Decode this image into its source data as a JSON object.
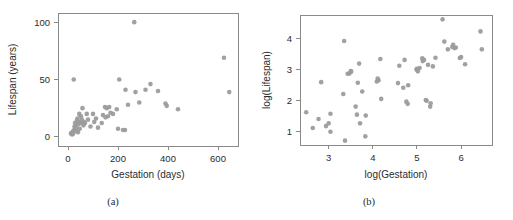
{
  "figure": {
    "background": "#ffffff",
    "point_color": "#9c9c9c",
    "axis_color": "#8a8a8a",
    "text_color": "#2b2b2b"
  },
  "panels": [
    {
      "key": "a",
      "caption": "(a)",
      "xlabel": "Gestation (days)",
      "ylabel": "Lifespan (years)"
    },
    {
      "key": "b",
      "caption": "(b)",
      "xlabel": "log(Gestation)",
      "ylabel": "log(Lifespan)"
    }
  ],
  "chart_data": [
    {
      "type": "scatter",
      "panel": "a",
      "title": "",
      "subtitle": "(a)",
      "xlabel": "Gestation (days)",
      "ylabel": "Lifespan (years)",
      "xlim": [
        -40,
        680
      ],
      "ylim": [
        -8,
        108
      ],
      "xticks": [
        0,
        200,
        400,
        600
      ],
      "xticklabels": [
        "0",
        "200",
        "400",
        "600"
      ],
      "yticks": [
        0,
        50,
        100
      ],
      "yticklabels": [
        "0",
        "50",
        "100"
      ],
      "grid": false,
      "legend": null,
      "marker": "circle",
      "marker_color": "#9c9c9c",
      "points": [
        [
          12,
          3.0
        ],
        [
          15,
          3.5
        ],
        [
          16,
          2.0
        ],
        [
          17,
          3.0
        ],
        [
          18,
          2.5
        ],
        [
          19,
          4.0
        ],
        [
          20,
          4.5
        ],
        [
          21,
          3.0
        ],
        [
          22,
          5.0
        ],
        [
          23,
          50.0
        ],
        [
          25,
          6.0
        ],
        [
          26,
          9.0
        ],
        [
          28,
          12.0
        ],
        [
          30,
          7.0
        ],
        [
          31,
          8.0
        ],
        [
          33,
          10.0
        ],
        [
          35,
          14.0
        ],
        [
          36,
          5.0
        ],
        [
          38,
          16.0
        ],
        [
          40,
          4.0
        ],
        [
          42,
          11.0
        ],
        [
          44,
          13.0
        ],
        [
          45,
          20.0
        ],
        [
          47,
          7.0
        ],
        [
          50,
          12.0
        ],
        [
          52,
          18.0
        ],
        [
          55,
          15.0
        ],
        [
          58,
          25.0
        ],
        [
          60,
          12.0
        ],
        [
          62,
          10.0
        ],
        [
          63,
          13.0
        ],
        [
          68,
          12.0
        ],
        [
          75,
          20.0
        ],
        [
          80,
          15.0
        ],
        [
          90,
          9.0
        ],
        [
          100,
          20.0
        ],
        [
          105,
          13.0
        ],
        [
          112,
          16.0
        ],
        [
          120,
          8.0
        ],
        [
          135,
          12.0
        ],
        [
          140,
          19.0
        ],
        [
          148,
          26.0
        ],
        [
          150,
          17.0
        ],
        [
          155,
          25.0
        ],
        [
          160,
          18.0
        ],
        [
          165,
          26.0
        ],
        [
          170,
          21.0
        ],
        [
          180,
          20.0
        ],
        [
          195,
          24.0
        ],
        [
          200,
          7.0
        ],
        [
          205,
          50.0
        ],
        [
          220,
          6.0
        ],
        [
          228,
          6.0
        ],
        [
          230,
          41.0
        ],
        [
          240,
          28.0
        ],
        [
          265,
          100.0
        ],
        [
          270,
          39.0
        ],
        [
          285,
          30.0
        ],
        [
          310,
          41.0
        ],
        [
          330,
          46.0
        ],
        [
          360,
          40.0
        ],
        [
          390,
          29.0
        ],
        [
          395,
          27.0
        ],
        [
          440,
          24.0
        ],
        [
          624,
          69.0
        ],
        [
          645,
          39.0
        ]
      ]
    },
    {
      "type": "scatter",
      "panel": "b",
      "title": "",
      "subtitle": "(b)",
      "xlabel": "log(Gestation)",
      "ylabel": "log(Lifespan)",
      "xlim": [
        2.35,
        6.7
      ],
      "ylim": [
        0.55,
        4.75
      ],
      "xticks": [
        3,
        4,
        5,
        6
      ],
      "xticklabels": [
        "3",
        "4",
        "5",
        "6"
      ],
      "yticks": [
        1,
        2,
        3,
        4
      ],
      "yticklabels": [
        "1",
        "2",
        "3",
        "4"
      ],
      "grid": false,
      "legend": null,
      "marker": "circle",
      "marker_color": "#9c9c9c",
      "points": [
        [
          2.49,
          1.61
        ],
        [
          2.64,
          1.1
        ],
        [
          2.77,
          1.39
        ],
        [
          2.83,
          2.58
        ],
        [
          2.94,
          1.16
        ],
        [
          3.0,
          1.25
        ],
        [
          3.04,
          1.56
        ],
        [
          3.04,
          0.98
        ],
        [
          3.33,
          2.2
        ],
        [
          3.35,
          3.91
        ],
        [
          3.37,
          0.69
        ],
        [
          3.43,
          2.85
        ],
        [
          3.47,
          2.86
        ],
        [
          3.5,
          2.94
        ],
        [
          3.51,
          2.92
        ],
        [
          3.61,
          1.79
        ],
        [
          3.64,
          1.53
        ],
        [
          3.66,
          2.56
        ],
        [
          3.69,
          3.18
        ],
        [
          3.71,
          1.25
        ],
        [
          3.76,
          2.28
        ],
        [
          3.83,
          0.83
        ],
        [
          3.84,
          1.5
        ],
        [
          4.09,
          2.6
        ],
        [
          4.11,
          2.7
        ],
        [
          4.13,
          2.64
        ],
        [
          4.17,
          3.33
        ],
        [
          4.19,
          2.04
        ],
        [
          4.57,
          2.55
        ],
        [
          4.6,
          3.11
        ],
        [
          4.69,
          2.4
        ],
        [
          4.72,
          3.3
        ],
        [
          4.76,
          1.95
        ],
        [
          4.79,
          1.88
        ],
        [
          4.8,
          2.48
        ],
        [
          4.99,
          2.99
        ],
        [
          5.0,
          3.01
        ],
        [
          5.02,
          2.93
        ],
        [
          5.06,
          3.04
        ],
        [
          5.12,
          3.35
        ],
        [
          5.13,
          3.26
        ],
        [
          5.16,
          3.3
        ],
        [
          5.2,
          2.0
        ],
        [
          5.22,
          1.98
        ],
        [
          5.25,
          3.14
        ],
        [
          5.3,
          1.79
        ],
        [
          5.31,
          1.9
        ],
        [
          5.36,
          3.09
        ],
        [
          5.42,
          3.37
        ],
        [
          5.58,
          4.61
        ],
        [
          5.62,
          3.89
        ],
        [
          5.7,
          3.64
        ],
        [
          5.8,
          3.72
        ],
        [
          5.82,
          3.79
        ],
        [
          5.85,
          3.68
        ],
        [
          5.88,
          3.7
        ],
        [
          5.97,
          3.36
        ],
        [
          6.0,
          3.39
        ],
        [
          6.09,
          3.16
        ],
        [
          6.44,
          4.22
        ],
        [
          6.47,
          3.64
        ]
      ]
    }
  ]
}
